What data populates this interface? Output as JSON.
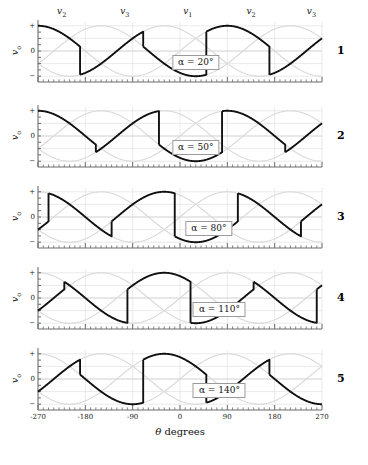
{
  "figure": {
    "width": 368,
    "height": 465,
    "background": "#ffffff"
  },
  "axis": {
    "x_title_symbol": "θ",
    "x_title_unit": "degrees",
    "x_ticks": [
      -270,
      -180,
      -90,
      0,
      90,
      180,
      270
    ],
    "x_tick_labels": [
      "-270",
      "-180",
      "-90",
      "0",
      "90",
      "180",
      "270"
    ],
    "x_minor_tick_step": 10,
    "y_label": "v",
    "y_label_sub": "o",
    "y_tick_labels": [
      "+",
      "0",
      "−"
    ],
    "y_minor_ticks": 8
  },
  "phase_labels": [
    {
      "text": "v",
      "sub": "2",
      "theta": -225
    },
    {
      "text": "v",
      "sub": "3",
      "theta": -105
    },
    {
      "text": "v",
      "sub": "1",
      "theta": 15
    },
    {
      "text": "v",
      "sub": "2",
      "theta": 135
    },
    {
      "text": "v",
      "sub": "3",
      "theta": 250
    }
  ],
  "colors": {
    "waveform": "#111111",
    "phase_sines": "#d8d8d8",
    "grid": "#e4e4e4",
    "axis": "#6a6a6a",
    "zero_line": "#d0d0d0",
    "box_border": "#9a9a9a",
    "text": "#111111"
  },
  "chart_data": {
    "type": "line",
    "title": "",
    "xlabel": "θ degrees",
    "ylabel": "v_o",
    "xlim": [
      -270,
      270
    ],
    "ylim": [
      -1.15,
      1.15
    ],
    "grid": true,
    "legend": "none",
    "phase_sines": {
      "amplitude": 1.0,
      "period_degrees": 360,
      "phases": [
        {
          "name": "v1",
          "phase_shift_degrees": 0
        },
        {
          "name": "v2",
          "phase_shift_degrees": -120
        },
        {
          "name": "v3",
          "phase_shift_degrees": 120
        }
      ]
    },
    "panels": [
      {
        "number": "1",
        "alpha_deg": 20,
        "alpha_label": "α = 20°",
        "conduction_degrees": 120
      },
      {
        "number": "2",
        "alpha_deg": 50,
        "alpha_label": "α = 50°",
        "conduction_degrees": 120
      },
      {
        "number": "3",
        "alpha_deg": 80,
        "alpha_label": "α = 80°",
        "conduction_degrees": 120
      },
      {
        "number": "4",
        "alpha_deg": 110,
        "alpha_label": "α = 110°",
        "conduction_degrees": 120
      },
      {
        "number": "5",
        "alpha_deg": 140,
        "alpha_label": "α = 140°",
        "conduction_degrees": 120
      }
    ],
    "panel_alpha_box_theta": [
      30,
      30,
      55,
      75,
      75
    ],
    "series_names": [
      "v_o",
      "v1",
      "v2",
      "v3"
    ]
  },
  "layout": {
    "plot_left": 38,
    "plot_right": 322,
    "panel_tops": [
      22,
      107,
      188,
      269,
      350
    ],
    "panel_height": 58,
    "panel_number_x": 337,
    "phase_label_y": 6
  }
}
